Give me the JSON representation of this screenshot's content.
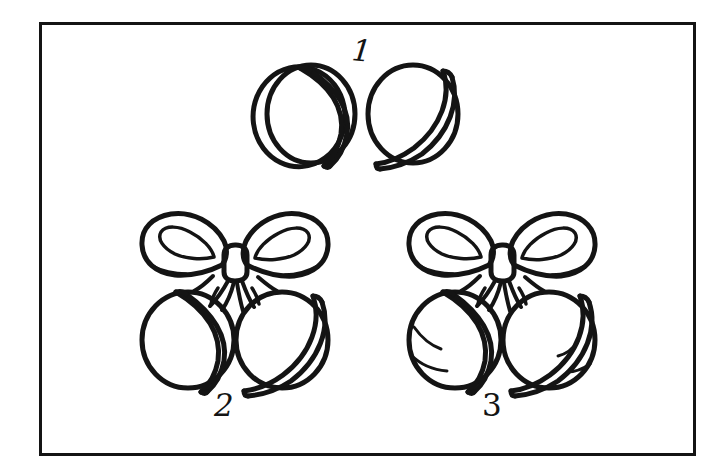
{
  "artwork": {
    "title": "Jingle Bells Line Art Worksheet",
    "style": "black-and-white coloring page line art",
    "background_color": "#ffffff",
    "ink_color": "#141414",
    "frame": {
      "name": "rectangular-border",
      "x": 39,
      "y": 22,
      "width": 657,
      "height": 434,
      "stroke_width": 3,
      "color": "#141414"
    }
  },
  "figures": [
    {
      "id": "figure-1",
      "number": "1",
      "label_position": "top",
      "description": "two jingle bells side by side without a bow",
      "parts": [
        "bell-left",
        "bell-right"
      ],
      "bell_count": 2,
      "has_bow": false,
      "has_interior_marks": false
    },
    {
      "id": "figure-2",
      "number": "2",
      "label_position": "bottom",
      "description": "two jingle bells tied together with a ribbon bow",
      "parts": [
        "bow-loop-left",
        "bow-loop-right",
        "knot",
        "ribbon-tails",
        "bell-left",
        "bell-right"
      ],
      "bell_count": 2,
      "has_bow": true,
      "has_interior_marks": false
    },
    {
      "id": "figure-3",
      "number": "3",
      "label_position": "bottom",
      "description": "two jingle bells tied with a ribbon bow, with extra interior shading strokes",
      "parts": [
        "bow-loop-left",
        "bow-loop-right",
        "knot",
        "ribbon-tails",
        "bell-left",
        "bell-right",
        "interior-strokes"
      ],
      "bell_count": 2,
      "has_bow": true,
      "has_interior_marks": true
    }
  ],
  "labels": {
    "one": "1",
    "two": "2",
    "three": "3"
  }
}
